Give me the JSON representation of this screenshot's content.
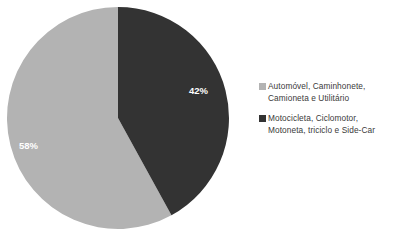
{
  "chart_data": {
    "type": "pie",
    "title": "",
    "labels": [
      "Automóvel, Caminhonete, Camioneta e Utilitário",
      "Motocicleta, Ciclomotor, Motoneta, triciclo e Side-Car"
    ],
    "values": [
      58,
      42
    ],
    "value_labels": [
      "58%",
      "42%"
    ],
    "colors": [
      "#b3b3b3",
      "#333333"
    ],
    "legend_position": "right",
    "grid": false,
    "start_angle_deg": 0,
    "direction": "clockwise"
  },
  "pie": {
    "slices": [
      {
        "name": "automoveis",
        "percent_label": "42%",
        "color": "#333333",
        "label_x": 183,
        "label_y": 88
      },
      {
        "name": "motocicletas",
        "percent_label": "58%",
        "color": "#b3b3b3",
        "label_x": 13,
        "label_y": 143
      }
    ]
  },
  "legend": {
    "entries": [
      {
        "swatch_color": "#b3b3b3",
        "label": "Automóvel, Caminhonete,\nCamioneta e Utilitário"
      },
      {
        "swatch_color": "#333333",
        "label": "Motocicleta, Ciclomotor,\nMotoneta, triciclo e Side-Car"
      }
    ]
  }
}
